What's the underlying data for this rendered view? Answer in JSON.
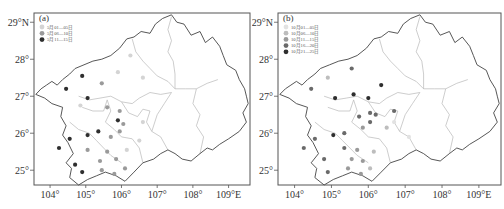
{
  "figure": {
    "panels": [
      {
        "id": "a",
        "label": "(a)",
        "legend": [
          {
            "text": "5月01—05日",
            "color": "#d4d4d4"
          },
          {
            "text": "5月06—10日",
            "color": "#9a9a9a"
          },
          {
            "text": "5月11—15日",
            "color": "#2e2e2e"
          }
        ],
        "stations": [
          {
            "lon": 104.9,
            "lat": 27.55,
            "cls": 2
          },
          {
            "lon": 104.45,
            "lat": 27.2,
            "cls": 2
          },
          {
            "lon": 105.05,
            "lat": 26.95,
            "cls": 2
          },
          {
            "lon": 105.45,
            "lat": 27.35,
            "cls": 1
          },
          {
            "lon": 104.85,
            "lat": 26.75,
            "cls": 0
          },
          {
            "lon": 105.6,
            "lat": 26.7,
            "cls": 1
          },
          {
            "lon": 105.95,
            "lat": 26.6,
            "cls": 1
          },
          {
            "lon": 105.9,
            "lat": 26.35,
            "cls": 2
          },
          {
            "lon": 106.05,
            "lat": 26.25,
            "cls": 1
          },
          {
            "lon": 105.95,
            "lat": 26.05,
            "cls": 1
          },
          {
            "lon": 105.7,
            "lat": 25.9,
            "cls": 1
          },
          {
            "lon": 104.55,
            "lat": 25.85,
            "cls": 2
          },
          {
            "lon": 105.05,
            "lat": 25.95,
            "cls": 2
          },
          {
            "lon": 105.35,
            "lat": 26.05,
            "cls": 2
          },
          {
            "lon": 105.05,
            "lat": 25.55,
            "cls": 1
          },
          {
            "lon": 105.6,
            "lat": 25.5,
            "cls": 1
          },
          {
            "lon": 105.85,
            "lat": 25.3,
            "cls": 1
          },
          {
            "lon": 105.4,
            "lat": 25.25,
            "cls": 1
          },
          {
            "lon": 104.7,
            "lat": 25.15,
            "cls": 2
          },
          {
            "lon": 104.25,
            "lat": 25.6,
            "cls": 2
          },
          {
            "lon": 104.9,
            "lat": 24.95,
            "cls": 2
          },
          {
            "lon": 105.45,
            "lat": 25.0,
            "cls": 1
          },
          {
            "lon": 105.8,
            "lat": 24.9,
            "cls": 1
          },
          {
            "lon": 106.1,
            "lat": 25.05,
            "cls": 1
          },
          {
            "lon": 106.15,
            "lat": 25.55,
            "cls": 0
          },
          {
            "lon": 106.6,
            "lat": 26.3,
            "cls": 0
          },
          {
            "lon": 106.5,
            "lat": 25.8,
            "cls": 0
          },
          {
            "lon": 106.6,
            "lat": 27.5,
            "cls": 0
          },
          {
            "lon": 106.25,
            "lat": 28.1,
            "cls": 0
          },
          {
            "lon": 105.9,
            "lat": 27.65,
            "cls": 0
          }
        ]
      },
      {
        "id": "b",
        "label": "(b)",
        "legend": [
          {
            "text": "10月01—05日",
            "color": "#e2e2e2"
          },
          {
            "text": "10月06—10日",
            "color": "#bdbdbd"
          },
          {
            "text": "10月11—15日",
            "color": "#9a9a9a"
          },
          {
            "text": "10月16—20日",
            "color": "#6a6a6a"
          },
          {
            "text": "10月21—25日",
            "color": "#2e2e2e"
          }
        ],
        "stations": [
          {
            "lon": 105.55,
            "lat": 27.75,
            "cls": 3
          },
          {
            "lon": 104.9,
            "lat": 27.5,
            "cls": 1
          },
          {
            "lon": 104.45,
            "lat": 27.2,
            "cls": 3
          },
          {
            "lon": 105.1,
            "lat": 26.95,
            "cls": 4
          },
          {
            "lon": 105.6,
            "lat": 27.05,
            "cls": 4
          },
          {
            "lon": 106.0,
            "lat": 26.95,
            "cls": 4
          },
          {
            "lon": 106.35,
            "lat": 27.3,
            "cls": 4
          },
          {
            "lon": 106.05,
            "lat": 26.55,
            "cls": 3
          },
          {
            "lon": 106.2,
            "lat": 26.5,
            "cls": 3
          },
          {
            "lon": 105.75,
            "lat": 26.45,
            "cls": 3
          },
          {
            "lon": 106.7,
            "lat": 26.6,
            "cls": 3
          },
          {
            "lon": 106.05,
            "lat": 26.3,
            "cls": 3
          },
          {
            "lon": 105.85,
            "lat": 26.15,
            "cls": 2
          },
          {
            "lon": 106.5,
            "lat": 26.15,
            "cls": 1
          },
          {
            "lon": 106.7,
            "lat": 26.3,
            "cls": 0
          },
          {
            "lon": 104.55,
            "lat": 25.85,
            "cls": 3
          },
          {
            "lon": 105.05,
            "lat": 25.95,
            "cls": 4
          },
          {
            "lon": 105.35,
            "lat": 26.0,
            "cls": 3
          },
          {
            "lon": 104.25,
            "lat": 25.6,
            "cls": 3
          },
          {
            "lon": 105.35,
            "lat": 25.6,
            "cls": 3
          },
          {
            "lon": 105.7,
            "lat": 25.55,
            "cls": 2
          },
          {
            "lon": 106.15,
            "lat": 25.5,
            "cls": 1
          },
          {
            "lon": 104.8,
            "lat": 25.3,
            "cls": 3
          },
          {
            "lon": 105.55,
            "lat": 25.3,
            "cls": 2
          },
          {
            "lon": 105.85,
            "lat": 25.25,
            "cls": 2
          },
          {
            "lon": 104.9,
            "lat": 24.95,
            "cls": 3
          },
          {
            "lon": 105.45,
            "lat": 25.05,
            "cls": 2
          },
          {
            "lon": 105.8,
            "lat": 24.9,
            "cls": 2
          },
          {
            "lon": 106.05,
            "lat": 25.05,
            "cls": 1
          },
          {
            "lon": 107.1,
            "lat": 25.9,
            "cls": 0
          }
        ]
      }
    ],
    "axes": {
      "x_ticks": [
        "104°",
        "105°",
        "106°",
        "107°",
        "108°",
        "109°E"
      ],
      "x_values": [
        104,
        105,
        106,
        107,
        108,
        109
      ],
      "y_ticks": [
        "25°",
        "26°",
        "27°",
        "28°",
        "29°N"
      ],
      "y_values": [
        25,
        26,
        27,
        28,
        29
      ],
      "lon_range": [
        103.55,
        109.6
      ],
      "lat_range": [
        24.6,
        29.25
      ]
    }
  }
}
